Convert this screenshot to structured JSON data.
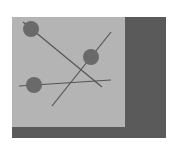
{
  "colors": {
    "background": "#ffffff",
    "frame": "#5a5a5a",
    "panel": "#b4b4b4",
    "node": "#6a6a6a",
    "edge": "#555555"
  },
  "frame": {
    "x": 12,
    "y": 17,
    "w": 154,
    "h": 121
  },
  "panel": {
    "x": 12,
    "y": 17,
    "w": 113,
    "h": 110
  },
  "nodes": [
    {
      "id": "node-1",
      "cx": 31,
      "cy": 29,
      "r": 8
    },
    {
      "id": "node-2",
      "cx": 91,
      "cy": 57,
      "r": 8
    },
    {
      "id": "node-3",
      "cx": 34,
      "cy": 85,
      "r": 8
    }
  ],
  "edges": [
    {
      "id": "edge-a",
      "x1": 23,
      "y1": 22,
      "x2": 102,
      "y2": 87
    },
    {
      "id": "edge-b",
      "x1": 111,
      "y1": 32,
      "x2": 52,
      "y2": 106
    },
    {
      "id": "edge-c",
      "x1": 19,
      "y1": 86,
      "x2": 111,
      "y2": 80
    }
  ]
}
